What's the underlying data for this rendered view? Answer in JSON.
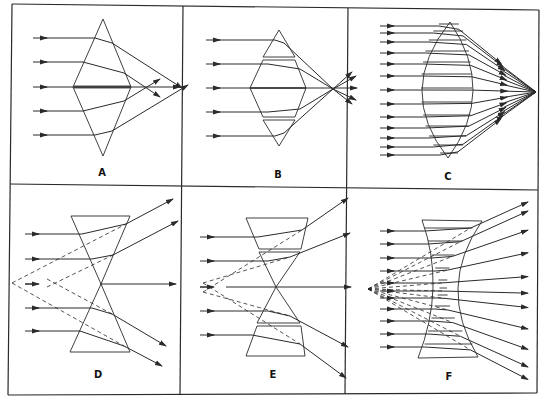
{
  "figure": {
    "panels": [
      {
        "id": "A",
        "label": "A",
        "kind": "two-prism converging",
        "rays": 5
      },
      {
        "id": "B",
        "label": "B",
        "kind": "four-prism converging",
        "rays": 5
      },
      {
        "id": "C",
        "label": "C",
        "kind": "many-prism converging lens",
        "rays": 13
      },
      {
        "id": "D",
        "label": "D",
        "kind": "two-prism diverging",
        "rays": 5
      },
      {
        "id": "E",
        "label": "E",
        "kind": "four-prism diverging",
        "rays": 5
      },
      {
        "id": "F",
        "label": "F",
        "kind": "many-prism diverging lens",
        "rays": 11
      }
    ],
    "colors": {
      "ink": "#2a2a2a",
      "background": "#ffffff"
    }
  }
}
